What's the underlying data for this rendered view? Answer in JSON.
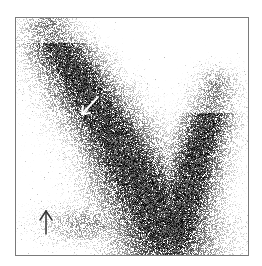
{
  "image": {
    "description": "Grayscale scintigraphy-style image showing a V-shaped region of dense dark speckled uptake on a white background, with two annotation arrows",
    "background_color": "#ffffff",
    "uptake_color": "#111111",
    "frame_color": "#7a7a7a",
    "annotations": [
      {
        "name": "upper-arrow",
        "color": "#ffffff",
        "direction": "down-left"
      },
      {
        "name": "lower-arrow",
        "color": "#333333",
        "direction": "up"
      }
    ]
  }
}
